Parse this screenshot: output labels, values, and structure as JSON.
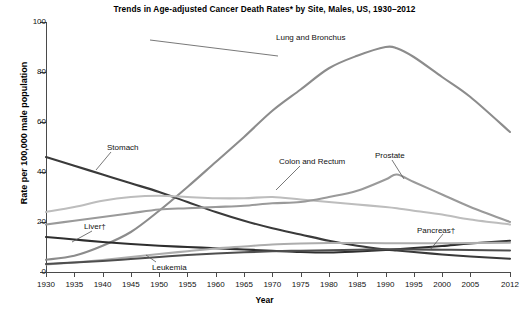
{
  "chart_data": {
    "type": "line",
    "title": "Trends in Age-adjusted Cancer Death Rates* by Site, Males, US, 1930–2012",
    "xlabel": "Year",
    "ylabel": "Rate per 100,000 male population",
    "xlim": [
      1930,
      2012
    ],
    "ylim": [
      0,
      100
    ],
    "yticks": [
      0,
      20,
      40,
      60,
      80,
      100
    ],
    "xticks": [
      1930,
      1935,
      1940,
      1945,
      1950,
      1955,
      1960,
      1965,
      1970,
      1975,
      1980,
      1985,
      1990,
      1995,
      2000,
      2005,
      2012
    ],
    "grid": false,
    "legend_position": "inline-annotations",
    "x": [
      1930,
      1935,
      1940,
      1945,
      1950,
      1955,
      1960,
      1965,
      1970,
      1975,
      1980,
      1985,
      1990,
      1992,
      1995,
      2000,
      2005,
      2012
    ],
    "series": [
      {
        "name": "Lung and Bronchus",
        "color": "#8c8c8c",
        "values": [
          4.9,
          6.5,
          10.5,
          16.0,
          24.5,
          34.0,
          44.0,
          54.0,
          64.5,
          73.0,
          81.5,
          86.5,
          90.0,
          89.5,
          86.0,
          78.0,
          70.0,
          56.0
        ]
      },
      {
        "name": "Stomach",
        "color": "#3a3a3a",
        "values": [
          46.0,
          42.5,
          39.0,
          35.5,
          32.0,
          28.0,
          24.0,
          20.5,
          17.5,
          15.0,
          12.5,
          10.5,
          9.0,
          8.6,
          8.0,
          7.0,
          6.2,
          5.3
        ]
      },
      {
        "name": "Colon and Rectum",
        "color": "#bdbdbd",
        "values": [
          24.0,
          26.0,
          28.5,
          30.0,
          30.5,
          30.0,
          29.5,
          29.5,
          30.0,
          29.0,
          28.0,
          27.0,
          26.0,
          25.5,
          24.5,
          23.0,
          21.0,
          19.0
        ]
      },
      {
        "name": "Prostate",
        "color": "#9a9a9a",
        "values": [
          19.0,
          20.5,
          22.0,
          23.5,
          25.0,
          25.5,
          26.0,
          26.5,
          27.5,
          28.0,
          30.0,
          32.5,
          37.0,
          39.0,
          36.0,
          31.0,
          26.0,
          20.0
        ]
      },
      {
        "name": "Liver†",
        "color": "#2e2e2e",
        "values": [
          14.0,
          13.0,
          12.0,
          11.2,
          10.5,
          10.0,
          9.5,
          9.0,
          8.5,
          8.0,
          7.8,
          8.2,
          8.8,
          9.1,
          9.6,
          10.4,
          11.4,
          12.5
        ]
      },
      {
        "name": "Pancreas†",
        "color": "#adadad",
        "values": [
          3.0,
          3.8,
          4.8,
          6.0,
          7.2,
          8.3,
          9.4,
          10.2,
          11.0,
          11.4,
          11.6,
          11.6,
          11.5,
          11.5,
          11.5,
          11.5,
          11.6,
          11.7
        ]
      },
      {
        "name": "Leukemia",
        "color": "#4e4e4e",
        "values": [
          3.2,
          3.8,
          4.4,
          5.2,
          6.0,
          6.8,
          7.4,
          7.9,
          8.3,
          8.5,
          8.7,
          8.9,
          9.1,
          9.1,
          9.0,
          8.9,
          8.8,
          8.6
        ]
      }
    ],
    "annotations": [
      {
        "label": "Lung and Bronchus",
        "x": 276,
        "y": 33
      },
      {
        "label": "Stomach",
        "x": 107,
        "y": 143
      },
      {
        "label": "Colon and Rectum",
        "x": 279,
        "y": 157
      },
      {
        "label": "Prostate",
        "x": 375,
        "y": 151
      },
      {
        "label": "Liver†",
        "x": 84,
        "y": 222
      },
      {
        "label": "Pancreas†",
        "x": 417,
        "y": 226
      },
      {
        "label": "Leukemia",
        "x": 152,
        "y": 263
      }
    ]
  },
  "footnote": ""
}
